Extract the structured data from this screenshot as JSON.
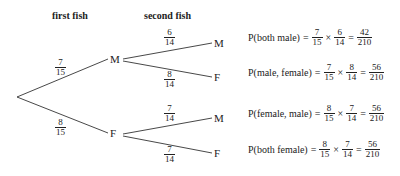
{
  "headers": {
    "first": "first fish",
    "second": "second fish"
  },
  "tree": {
    "root": "",
    "first": [
      {
        "label": "M",
        "prob": {
          "num": "7",
          "den": "15"
        },
        "children": [
          {
            "label": "M",
            "prob": {
              "num": "6",
              "den": "14"
            }
          },
          {
            "label": "F",
            "prob": {
              "num": "8",
              "den": "14"
            }
          }
        ]
      },
      {
        "label": "F",
        "prob": {
          "num": "8",
          "den": "15"
        },
        "children": [
          {
            "label": "M",
            "prob": {
              "num": "7",
              "den": "14"
            }
          },
          {
            "label": "F",
            "prob": {
              "num": "7",
              "den": "14"
            }
          }
        ]
      }
    ]
  },
  "equations": [
    {
      "lhs": "P(both male)",
      "eq": "=",
      "a": {
        "num": "7",
        "den": "15"
      },
      "times": "×",
      "b": {
        "num": "6",
        "den": "14"
      },
      "eq2": "=",
      "r": {
        "num": "42",
        "den": "210"
      }
    },
    {
      "lhs": "P(male, female)",
      "eq": "=",
      "a": {
        "num": "7",
        "den": "15"
      },
      "times": "×",
      "b": {
        "num": "8",
        "den": "14"
      },
      "eq2": "=",
      "r": {
        "num": "56",
        "den": "210"
      }
    },
    {
      "lhs": "P(female, male)",
      "eq": "=",
      "a": {
        "num": "8",
        "den": "15"
      },
      "times": "×",
      "b": {
        "num": "7",
        "den": "14"
      },
      "eq2": "=",
      "r": {
        "num": "56",
        "den": "210"
      }
    },
    {
      "lhs": "P(both female)",
      "eq": "=",
      "a": {
        "num": "8",
        "den": "15"
      },
      "times": "×",
      "b": {
        "num": "7",
        "den": "14"
      },
      "eq2": "=",
      "r": {
        "num": "56",
        "den": "210"
      }
    }
  ]
}
